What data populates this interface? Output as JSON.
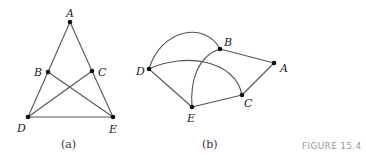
{
  "figure_label": "FIGURE 15.4",
  "graph_a": {
    "caption": "(a)",
    "nodes": {
      "A": "A",
      "B": "B",
      "C": "C",
      "D": "D",
      "E": "E"
    },
    "edges": [
      [
        "A",
        "B"
      ],
      [
        "B",
        "D"
      ],
      [
        "A",
        "C"
      ],
      [
        "C",
        "E"
      ],
      [
        "D",
        "E"
      ],
      [
        "B",
        "E"
      ],
      [
        "C",
        "D"
      ]
    ]
  },
  "graph_b": {
    "caption": "(b)",
    "nodes": {
      "A": "A",
      "B": "B",
      "C": "C",
      "D": "D",
      "E": "E"
    },
    "edges": [
      [
        "B",
        "A"
      ],
      [
        "A",
        "C"
      ],
      [
        "C",
        "E"
      ],
      [
        "E",
        "D"
      ],
      [
        "D",
        "B"
      ],
      [
        "D",
        "C"
      ],
      [
        "B",
        "E"
      ]
    ]
  }
}
